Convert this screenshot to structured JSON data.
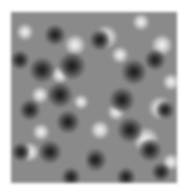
{
  "image": {
    "description": "Grayscale reaction-diffusion (Turing) spot pattern",
    "colors": {
      "background": "#ffffff",
      "base": "#8a8a8a",
      "dark": "#161616",
      "light": "#f4f4f4"
    },
    "dark_spots": [
      [
        61,
        54,
        26
      ],
      [
        31,
        58,
        24
      ],
      [
        49,
        83,
        24
      ],
      [
        123,
        60,
        24
      ],
      [
        111,
        88,
        24
      ],
      [
        119,
        118,
        24
      ],
      [
        57,
        110,
        22
      ],
      [
        39,
        140,
        22
      ],
      [
        84,
        148,
        22
      ],
      [
        19,
        98,
        20
      ],
      [
        144,
        48,
        20
      ],
      [
        89,
        28,
        20
      ],
      [
        44,
        23,
        20
      ],
      [
        139,
        138,
        22
      ],
      [
        9,
        48,
        18
      ],
      [
        154,
        98,
        18
      ],
      [
        10,
        140,
        18
      ],
      [
        150,
        160,
        18
      ],
      [
        60,
        165,
        18
      ],
      [
        115,
        165,
        18
      ]
    ],
    "light_spots": [
      [
        95,
        25,
        22
      ],
      [
        64,
        33,
        20
      ],
      [
        151,
        33,
        20
      ],
      [
        149,
        96,
        22
      ],
      [
        135,
        128,
        24
      ],
      [
        81,
        148,
        18
      ],
      [
        19,
        140,
        18
      ],
      [
        49,
        63,
        16
      ],
      [
        29,
        83,
        16
      ],
      [
        89,
        118,
        18
      ],
      [
        109,
        43,
        16
      ],
      [
        14,
        20,
        16
      ],
      [
        105,
        100,
        16
      ],
      [
        130,
        10,
        16
      ],
      [
        160,
        70,
        16
      ],
      [
        70,
        90,
        14
      ],
      [
        30,
        120,
        16
      ],
      [
        160,
        150,
        16
      ]
    ]
  }
}
